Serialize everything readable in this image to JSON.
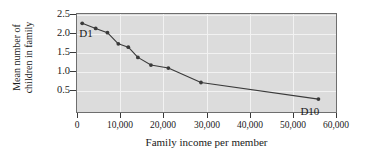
{
  "chart_data": {
    "type": "line",
    "title": "",
    "xlabel": "Family income per member",
    "ylabel": "Mean number of children in family",
    "ylabel_lines": [
      "Mean number of",
      "children in family"
    ],
    "xlim": [
      0,
      60000
    ],
    "ylim": [
      0.25,
      2.6
    ],
    "xticks": [
      0,
      10000,
      20000,
      30000,
      40000,
      50000,
      60000
    ],
    "xticklabels": [
      "0",
      "10,000",
      "20,000",
      "30,000",
      "40,000",
      "50,000",
      "60,000"
    ],
    "yticks": [
      0.5,
      1.0,
      1.5,
      2.0,
      2.5
    ],
    "yticklabels": [
      "0.5",
      "1.0",
      "1.5",
      "2.0",
      "2.5"
    ],
    "grid": true,
    "legend": "none",
    "marker": "filled-circle",
    "line_color": "#3a3a3a",
    "marker_color": "#3a3a3a",
    "plot_background": "#dcdcdc",
    "grid_color": "#f2f2f2",
    "x": [
      1200,
      4300,
      7000,
      9500,
      11800,
      14000,
      17000,
      21000,
      28500,
      55500
    ],
    "values": [
      2.38,
      2.26,
      2.16,
      1.9,
      1.82,
      1.58,
      1.4,
      1.33,
      0.99,
      0.6
    ],
    "point_labels": [
      "D1",
      "D2",
      "D3",
      "D4",
      "D5",
      "D6",
      "D7",
      "D8",
      "D9",
      "D10"
    ],
    "annotations": [
      {
        "text": "D1",
        "x": 1200,
        "y": 2.38,
        "position": "below-right"
      },
      {
        "text": "D10",
        "x": 55500,
        "y": 0.6,
        "position": "below-left"
      }
    ]
  }
}
